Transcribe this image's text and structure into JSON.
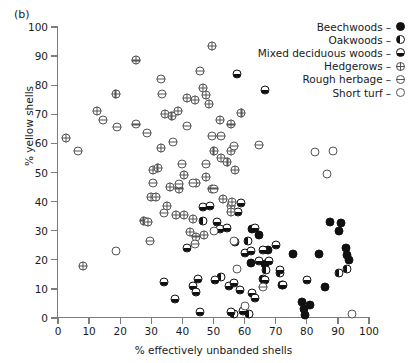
{
  "panel_label": "(b)",
  "chart_data": {
    "type": "scatter",
    "title": "",
    "xlabel": "% effectively unbanded shells",
    "ylabel": "% yellow shells",
    "xlim": [
      0,
      100
    ],
    "ylim": [
      0,
      100
    ],
    "xticks": [
      0,
      10,
      20,
      30,
      40,
      50,
      60,
      70,
      80,
      90,
      100
    ],
    "yticks": [
      0,
      10,
      20,
      30,
      40,
      50,
      60,
      70,
      80,
      90,
      100
    ],
    "grid": false,
    "legend_position": "top-right",
    "legend": [
      {
        "name": "Beechwoods",
        "marker": "filled-circle",
        "key": "beech"
      },
      {
        "name": "Oakwoods",
        "marker": "left-half-filled-circle",
        "key": "oak"
      },
      {
        "name": "Mixed deciduous woods",
        "marker": "bottom-half-filled-circle",
        "key": "mixed"
      },
      {
        "name": "Hedgerows",
        "marker": "crossed-circle",
        "key": "hedge"
      },
      {
        "name": "Rough herbage",
        "marker": "horizontal-line-circle",
        "key": "rough"
      },
      {
        "name": "Short turf",
        "marker": "open-circle",
        "key": "short"
      }
    ],
    "series": [
      {
        "name": "Beechwoods",
        "key": "beech",
        "points": [
          [
            62.5,
            30.5
          ],
          [
            64.5,
            28.5
          ],
          [
            67.5,
            23.5
          ],
          [
            72.0,
            11.5
          ],
          [
            75.5,
            22.0
          ],
          [
            78.5,
            5.5
          ],
          [
            79.0,
            3.0
          ],
          [
            79.5,
            1.0
          ],
          [
            81.0,
            4.5
          ],
          [
            84.0,
            22.0
          ],
          [
            87.5,
            33.0
          ],
          [
            90.5,
            30.0
          ],
          [
            91.0,
            32.5
          ],
          [
            92.5,
            24.0
          ],
          [
            93.0,
            21.5
          ],
          [
            93.5,
            20.0
          ],
          [
            86.0,
            10.5
          ],
          [
            62.0,
            19.0
          ],
          [
            66.5,
            18.5
          ]
        ]
      },
      {
        "name": "Oakwoods",
        "key": "oak",
        "points": [
          [
            46.5,
            33.5
          ],
          [
            52.5,
            14.0
          ],
          [
            56.5,
            1.5
          ],
          [
            61.0,
            26.5
          ],
          [
            66.0,
            13.5
          ],
          [
            71.5,
            15.5
          ],
          [
            90.5,
            15.5
          ],
          [
            93.0,
            17.0
          ],
          [
            61.5,
            1.5
          ],
          [
            67.0,
            16.5
          ]
        ]
      },
      {
        "name": "Mixed deciduous woods",
        "key": "mixed",
        "points": [
          [
            57.5,
            84.0
          ],
          [
            66.5,
            78.5
          ],
          [
            46.5,
            38.0
          ],
          [
            49.0,
            38.5
          ],
          [
            51.0,
            33.0
          ],
          [
            52.0,
            30.5
          ],
          [
            54.5,
            31.0
          ],
          [
            57.0,
            26.0
          ],
          [
            58.0,
            36.5
          ],
          [
            60.0,
            22.5
          ],
          [
            62.0,
            23.0
          ],
          [
            63.5,
            31.0
          ],
          [
            64.5,
            19.5
          ],
          [
            66.0,
            23.5
          ],
          [
            68.0,
            19.5
          ],
          [
            70.0,
            25.0
          ],
          [
            71.5,
            16.5
          ],
          [
            72.5,
            11.5
          ],
          [
            45.0,
            13.5
          ],
          [
            50.5,
            13.0
          ],
          [
            55.0,
            11.0
          ],
          [
            56.5,
            12.0
          ],
          [
            58.5,
            9.5
          ],
          [
            62.5,
            8.5
          ],
          [
            41.5,
            24.0
          ],
          [
            43.5,
            11.0
          ],
          [
            44.5,
            9.0
          ],
          [
            55.5,
            2.0
          ],
          [
            59.5,
            2.5
          ],
          [
            63.5,
            7.0
          ],
          [
            66.5,
            13.0
          ],
          [
            80.0,
            13.0
          ],
          [
            45.5,
            2.0
          ],
          [
            34.0,
            12.5
          ],
          [
            37.5,
            6.5
          ],
          [
            59.0,
            39.5
          ]
        ]
      },
      {
        "name": "Hedgerows",
        "key": "hedge",
        "points": [
          [
            2.5,
            62.0
          ],
          [
            12.5,
            71.0
          ],
          [
            18.5,
            77.0
          ],
          [
            25.0,
            88.5
          ],
          [
            34.5,
            70.0
          ],
          [
            36.5,
            69.5
          ],
          [
            38.5,
            71.0
          ],
          [
            41.5,
            75.5
          ],
          [
            44.0,
            75.0
          ],
          [
            46.5,
            79.0
          ],
          [
            47.5,
            76.5
          ],
          [
            48.5,
            73.5
          ],
          [
            52.0,
            68.0
          ],
          [
            55.5,
            66.5
          ],
          [
            49.5,
            93.5
          ],
          [
            59.0,
            70.5
          ],
          [
            33.0,
            58.5
          ],
          [
            30.5,
            51.0
          ],
          [
            32.0,
            51.5
          ],
          [
            52.5,
            55.0
          ],
          [
            54.5,
            53.5
          ],
          [
            57.0,
            51.0
          ],
          [
            36.0,
            45.0
          ],
          [
            40.5,
            49.0
          ],
          [
            30.0,
            41.5
          ],
          [
            31.5,
            41.5
          ],
          [
            39.0,
            44.5
          ],
          [
            44.5,
            46.5
          ],
          [
            47.5,
            48.5
          ],
          [
            49.5,
            44.5
          ],
          [
            35.0,
            38.5
          ],
          [
            38.0,
            35.5
          ],
          [
            40.5,
            35.5
          ],
          [
            43.5,
            34.0
          ],
          [
            53.0,
            41.0
          ],
          [
            55.5,
            38.5
          ],
          [
            55.5,
            36.5
          ],
          [
            42.5,
            29.5
          ],
          [
            44.5,
            28.0
          ],
          [
            47.0,
            28.5
          ],
          [
            8.0,
            18.0
          ],
          [
            50.0,
            57.5
          ],
          [
            55.5,
            57.5
          ],
          [
            56.0,
            40.0
          ],
          [
            27.5,
            33.5
          ],
          [
            29.0,
            33.0
          ]
        ]
      },
      {
        "name": "Rough herbage",
        "key": "rough",
        "points": [
          [
            6.5,
            57.5
          ],
          [
            14.5,
            68.0
          ],
          [
            33.0,
            82.0
          ],
          [
            33.5,
            77.0
          ],
          [
            41.5,
            66.0
          ],
          [
            45.5,
            85.0
          ],
          [
            49.5,
            62.5
          ],
          [
            52.5,
            62.5
          ],
          [
            56.5,
            59.0
          ],
          [
            64.5,
            59.5
          ],
          [
            19.0,
            65.5
          ],
          [
            37.0,
            60.5
          ],
          [
            30.5,
            46.5
          ],
          [
            39.0,
            46.0
          ],
          [
            43.5,
            46.5
          ],
          [
            50.0,
            44.5
          ],
          [
            34.0,
            36.0
          ],
          [
            29.5,
            26.5
          ],
          [
            44.0,
            25.5
          ],
          [
            66.0,
            10.5
          ],
          [
            25.0,
            66.5
          ],
          [
            28.5,
            63.5
          ],
          [
            40.0,
            53.0
          ],
          [
            47.5,
            53.0
          ]
        ]
      },
      {
        "name": "Short turf",
        "key": "short",
        "points": [
          [
            18.5,
            23.0
          ],
          [
            56.5,
            26.5
          ],
          [
            60.0,
            4.0
          ],
          [
            82.5,
            57.0
          ],
          [
            86.5,
            49.5
          ],
          [
            88.5,
            57.5
          ],
          [
            94.5,
            1.5
          ],
          [
            57.5,
            17.0
          ],
          [
            50.0,
            30.0
          ]
        ]
      }
    ]
  }
}
